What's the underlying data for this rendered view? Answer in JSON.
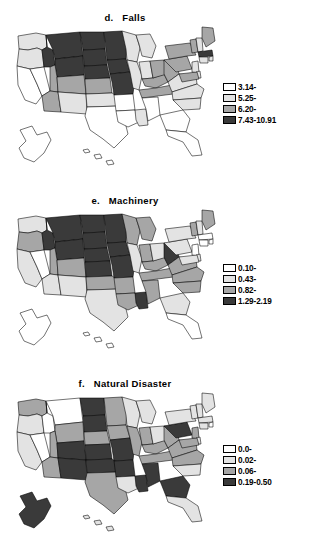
{
  "figure": {
    "background_color": "#ffffff",
    "panel_count": 3
  },
  "palette": {
    "class1": "#ffffff",
    "class2": "#e3e3e3",
    "class3": "#a6a6a6",
    "class4": "#3a3a3a",
    "outline": "#000000",
    "text": "#000000"
  },
  "panels": [
    {
      "id": "panel-falls",
      "title": "d.   Falls",
      "letter": "d.",
      "name": "Falls",
      "legend": [
        {
          "swatch": "class1",
          "label": "3.14-"
        },
        {
          "swatch": "class2",
          "label": "5.25-"
        },
        {
          "swatch": "class3",
          "label": "6.20-"
        },
        {
          "swatch": "class4",
          "label": "7.43-10.91"
        }
      ]
    },
    {
      "id": "panel-machinery",
      "title": "e.   Machinery",
      "letter": "e.",
      "name": "Machinery",
      "legend": [
        {
          "swatch": "class1",
          "label": "0.10-"
        },
        {
          "swatch": "class2",
          "label": "0.43-"
        },
        {
          "swatch": "class3",
          "label": "0.82-"
        },
        {
          "swatch": "class4",
          "label": "1.29-2.19"
        }
      ]
    },
    {
      "id": "panel-natural-disaster",
      "title": "f.   Natural Disaster",
      "letter": "f.",
      "name": "Natural Disaster",
      "legend": [
        {
          "swatch": "class1",
          "label": "0.0-"
        },
        {
          "swatch": "class2",
          "label": "0.02-"
        },
        {
          "swatch": "class3",
          "label": "0.06-"
        },
        {
          "swatch": "class4",
          "label": "0.19-0.50"
        }
      ]
    }
  ],
  "chart_data": {
    "type": "heatmap",
    "subtype": "choropleth-map-series",
    "region": "United States including Alaska and Hawaii insets",
    "class_count": 4,
    "maps": [
      {
        "panel": "d",
        "title": "d.   Falls",
        "variable": "Falls",
        "legend_breaks": [
          "3.14-",
          "5.25-",
          "6.20-",
          "7.43-10.91"
        ],
        "class_colors": [
          "#ffffff",
          "#e3e3e3",
          "#a6a6a6",
          "#3a3a3a"
        ],
        "state_classes": {
          "WA": 2,
          "OR": 2,
          "CA": 1,
          "NV": 1,
          "ID": 4,
          "MT": 4,
          "WY": 4,
          "UT": 3,
          "AZ": 3,
          "CO": 3,
          "NM": 2,
          "ND": 4,
          "SD": 4,
          "NE": 4,
          "KS": 3,
          "OK": 2,
          "TX": 1,
          "MN": 4,
          "IA": 4,
          "MO": 4,
          "AR": 1,
          "LA": 1,
          "WI": 2,
          "IL": 2,
          "MS": 2,
          "MI": 2,
          "IN": 2,
          "KY": 3,
          "TN": 3,
          "AL": 1,
          "OH": 3,
          "WV": 3,
          "VA": 2,
          "NC": 2,
          "SC": 2,
          "GA": 1,
          "FL": 1,
          "PA": 3,
          "NY": 3,
          "VT": 3,
          "NH": 2,
          "ME": 3,
          "MA": 4,
          "RI": 2,
          "CT": 2,
          "NJ": 2,
          "DE": 2,
          "MD": 3,
          "AK": 1,
          "HI": 1
        }
      },
      {
        "panel": "e",
        "title": "e.   Machinery",
        "variable": "Machinery",
        "legend_breaks": [
          "0.10-",
          "0.43-",
          "0.82-",
          "1.29-2.19"
        ],
        "class_colors": [
          "#ffffff",
          "#e3e3e3",
          "#a6a6a6",
          "#3a3a3a"
        ],
        "state_classes": {
          "WA": 2,
          "OR": 3,
          "CA": 2,
          "NV": 1,
          "ID": 4,
          "MT": 4,
          "WY": 4,
          "UT": 3,
          "AZ": 2,
          "CO": 3,
          "NM": 2,
          "ND": 4,
          "SD": 4,
          "NE": 4,
          "KS": 4,
          "OK": 3,
          "TX": 2,
          "MN": 4,
          "IA": 4,
          "MO": 4,
          "AR": 3,
          "LA": 3,
          "WI": 3,
          "IL": 2,
          "MS": 4,
          "MI": 3,
          "IN": 3,
          "KY": 3,
          "TN": 3,
          "AL": 3,
          "OH": 2,
          "WV": 4,
          "VA": 3,
          "NC": 3,
          "SC": 3,
          "GA": 2,
          "FL": 1,
          "PA": 2,
          "NY": 2,
          "VT": 3,
          "NH": 2,
          "ME": 3,
          "MA": 1,
          "RI": 1,
          "CT": 1,
          "NJ": 1,
          "DE": 2,
          "MD": 2,
          "AK": 1,
          "HI": 1
        }
      },
      {
        "panel": "f",
        "title": "f.   Natural Disaster",
        "variable": "Natural Disaster",
        "legend_breaks": [
          "0.0-",
          "0.02-",
          "0.06-",
          "0.19-0.50"
        ],
        "class_colors": [
          "#ffffff",
          "#e3e3e3",
          "#a6a6a6",
          "#3a3a3a"
        ],
        "state_classes": {
          "WA": 3,
          "OR": 2,
          "CA": 2,
          "NV": 1,
          "ID": 1,
          "MT": 1,
          "WY": 3,
          "UT": 3,
          "AZ": 3,
          "CO": 4,
          "NM": 4,
          "ND": 4,
          "SD": 4,
          "NE": 3,
          "KS": 4,
          "OK": 4,
          "TX": 3,
          "MN": 3,
          "IA": 3,
          "MO": 4,
          "AR": 4,
          "LA": 2,
          "WI": 2,
          "IL": 3,
          "MS": 4,
          "MI": 2,
          "IN": 3,
          "KY": 3,
          "TN": 3,
          "AL": 4,
          "OH": 2,
          "WV": 3,
          "VA": 3,
          "NC": 3,
          "SC": 2,
          "GA": 4,
          "FL": 2,
          "PA": 4,
          "NY": 2,
          "VT": 2,
          "NH": 2,
          "ME": 2,
          "MA": 2,
          "RI": 1,
          "CT": 2,
          "NJ": 3,
          "DE": 2,
          "MD": 3,
          "AK": 4,
          "HI": 2
        }
      }
    ]
  }
}
